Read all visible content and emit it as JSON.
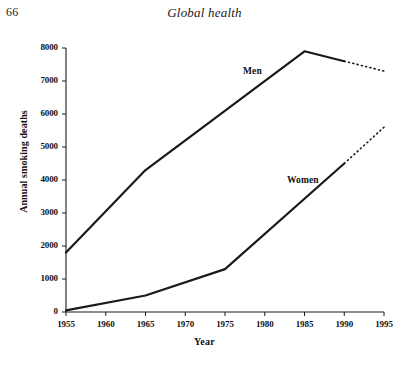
{
  "page": {
    "number": "66",
    "running_head": "Global health"
  },
  "chart_data": {
    "type": "line",
    "title": "",
    "subtitle": "",
    "xlabel": "Year",
    "ylabel": "Annual smoking deaths",
    "x": [
      1955,
      1960,
      1965,
      1970,
      1975,
      1980,
      1985,
      1990,
      1995
    ],
    "xlim": [
      1953,
      1996
    ],
    "ylim": [
      0,
      8000
    ],
    "xtick_labels": [
      "1955",
      "1960",
      "1965",
      "1970",
      "1975",
      "1980",
      "1985",
      "1990",
      "1995"
    ],
    "ytick_labels": [
      "0",
      "1000",
      "2000",
      "3000",
      "4000",
      "5000",
      "6000",
      "7000",
      "8000"
    ],
    "yticks": [
      0,
      1000,
      2000,
      3000,
      4000,
      5000,
      6000,
      7000,
      8000
    ],
    "grid": false,
    "legend_position": "inline-annotation",
    "line_color": "#1a1a1a",
    "series": [
      {
        "name": "Men",
        "label": "Men",
        "style": "solid",
        "points": [
          {
            "x": 1955,
            "y": 1800
          },
          {
            "x": 1965,
            "y": 4300
          },
          {
            "x": 1985,
            "y": 7900
          },
          {
            "x": 1990,
            "y": 7600
          }
        ],
        "projection_style": "dotted",
        "projection_points": [
          {
            "x": 1990,
            "y": 7600
          },
          {
            "x": 1995,
            "y": 7300
          }
        ]
      },
      {
        "name": "Women",
        "label": "Women",
        "style": "solid",
        "points": [
          {
            "x": 1955,
            "y": 50
          },
          {
            "x": 1965,
            "y": 500
          },
          {
            "x": 1975,
            "y": 1300
          },
          {
            "x": 1990,
            "y": 4500
          }
        ],
        "projection_style": "dotted",
        "projection_points": [
          {
            "x": 1990,
            "y": 4500
          },
          {
            "x": 1995,
            "y": 5600
          }
        ]
      }
    ]
  }
}
